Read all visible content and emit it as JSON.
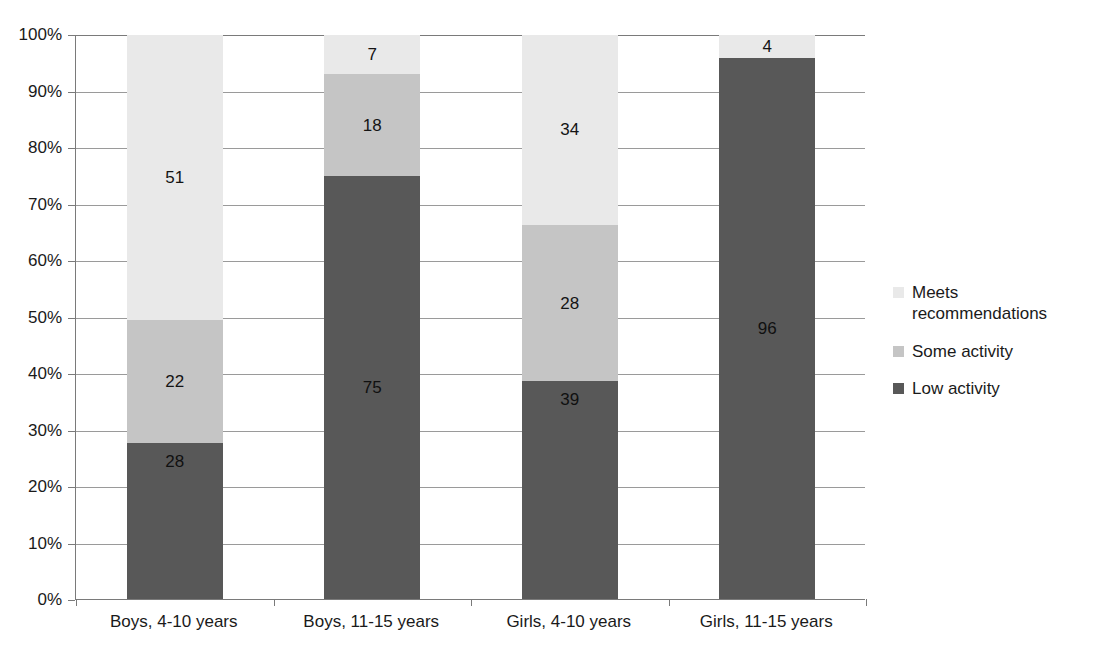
{
  "chart_data": {
    "type": "bar",
    "subtype": "stacked-bar-100-percent",
    "title": "",
    "subtitle": "",
    "xlabel": "",
    "ylabel": "",
    "categories": [
      "Boys, 4-10 years",
      "Boys, 11-15 years",
      "Girls, 4-10 years",
      "Girls, 11-15 years"
    ],
    "series": [
      {
        "name": "Low activity",
        "color": "#585858",
        "values": [
          28,
          75,
          39,
          96
        ]
      },
      {
        "name": "Some activity",
        "color": "#c5c5c5",
        "values": [
          22,
          18,
          28,
          0
        ]
      },
      {
        "name": "Meets recommendations",
        "color": "#e9e9e9",
        "values": [
          51,
          7,
          34,
          4
        ]
      }
    ],
    "stack_order_bottom_to_top": [
      "Low activity",
      "Some activity",
      "Meets recommendations"
    ],
    "ylim": [
      0,
      100
    ],
    "ytick_labels": [
      "0%",
      "10%",
      "20%",
      "30%",
      "40%",
      "50%",
      "60%",
      "70%",
      "80%",
      "90%",
      "100%"
    ],
    "ytick_values": [
      0,
      10,
      20,
      30,
      40,
      50,
      60,
      70,
      80,
      90,
      100
    ],
    "grid": true,
    "grid_axis": "y",
    "legend_position": "right",
    "data_labels_shown": true,
    "hidden_zero_labels": [
      "Some activity / Girls, 11-15 years"
    ]
  },
  "legend": {
    "items": [
      {
        "label": "Meets recommendations",
        "color": "#e9e9e9"
      },
      {
        "label": "Some activity",
        "color": "#c5c5c5"
      },
      {
        "label": "Low activity",
        "color": "#585858"
      }
    ]
  },
  "axis": {
    "y_labels": [
      "100%",
      "90%",
      "80%",
      "70%",
      "60%",
      "50%",
      "40%",
      "30%",
      "20%",
      "10%",
      "0%"
    ],
    "x_labels": [
      "Boys, 4-10 years",
      "Boys, 11-15 years",
      "Girls, 4-10 years",
      "Girls, 11-15 years"
    ]
  },
  "bar_labels": {
    "b0": {
      "low": "28",
      "some": "22",
      "meets": "51"
    },
    "b1": {
      "low": "75",
      "some": "18",
      "meets": "7"
    },
    "b2": {
      "low": "39",
      "some": "28",
      "meets": "34"
    },
    "b3": {
      "low": "96",
      "some": "",
      "meets": "4"
    }
  }
}
